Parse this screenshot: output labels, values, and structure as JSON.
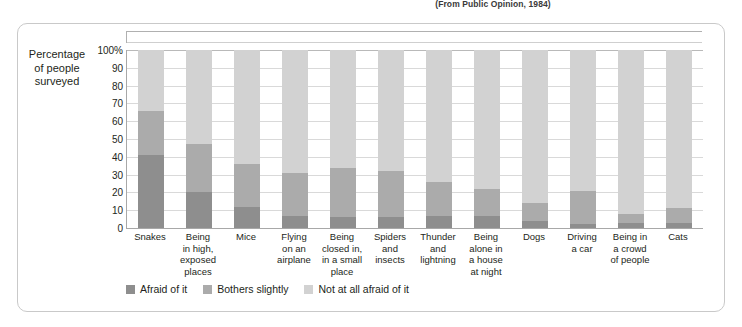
{
  "source_note": "(From Public Opinion, 1984)",
  "axis_title": "Percentage\nof people\nsurveyed",
  "axis_title_lines": [
    "Percentage",
    "of people",
    "surveyed"
  ],
  "colors": {
    "afraid": "#8e8e8e",
    "bothers": "#ababab",
    "not_afraid": "#d2d2d2",
    "gridline": "#d9d9d9",
    "axis": "#a8a8a8",
    "frame": "#c9c9c9",
    "text": "#231f20"
  },
  "legend": {
    "items": [
      {
        "label": "Afraid of it",
        "color_key": "afraid"
      },
      {
        "label": "Bothers slightly",
        "color_key": "bothers"
      },
      {
        "label": "Not at all afraid of it",
        "color_key": "not_afraid"
      }
    ]
  },
  "chart_data": {
    "type": "bar",
    "title": "",
    "subtitle": "",
    "xlabel": "",
    "ylabel": "Percentage of people surveyed",
    "ylim": [
      0,
      100
    ],
    "ytick_labels": [
      "100%",
      "90",
      "80",
      "70",
      "60",
      "50",
      "40",
      "30",
      "20",
      "10",
      "0"
    ],
    "ytick_values": [
      100,
      90,
      80,
      70,
      60,
      50,
      40,
      30,
      20,
      10,
      0
    ],
    "grid": true,
    "stacked": true,
    "legend_position": "bottom-left",
    "categories": [
      "Snakes",
      "Being in high, exposed places",
      "Mice",
      "Flying on an airplane",
      "Being closed in, in a small place",
      "Spiders and insects",
      "Thunder and lightning",
      "Being alone in a house at night",
      "Dogs",
      "Driving a car",
      "Being in a crowd of people",
      "Cats"
    ],
    "category_lines": [
      [
        "Snakes"
      ],
      [
        "Being",
        "in high,",
        "exposed",
        "places"
      ],
      [
        "Mice"
      ],
      [
        "Flying",
        "on an",
        "airplane"
      ],
      [
        "Being",
        "closed in,",
        "in a small",
        "place"
      ],
      [
        "Spiders",
        "and",
        "insects"
      ],
      [
        "Thunder",
        "and",
        "lightning"
      ],
      [
        "Being",
        "alone in",
        "a house",
        "at night"
      ],
      [
        "Dogs"
      ],
      [
        "Driving",
        "a car"
      ],
      [
        "Being in",
        "a crowd",
        "of people"
      ],
      [
        "Cats"
      ]
    ],
    "series": [
      {
        "name": "Afraid of it",
        "color": "#8e8e8e",
        "values": [
          41,
          20,
          12,
          7,
          6,
          6,
          7,
          7,
          4,
          2,
          3,
          3
        ]
      },
      {
        "name": "Bothers slightly",
        "color": "#ababab",
        "values": [
          25,
          27,
          24,
          24,
          28,
          26,
          19,
          15,
          10,
          19,
          5,
          8
        ]
      },
      {
        "name": "Not at all afraid of it",
        "color": "#d2d2d2",
        "values": [
          34,
          53,
          64,
          69,
          66,
          68,
          74,
          78,
          86,
          79,
          92,
          89
        ]
      }
    ],
    "cumulative_tops": {
      "afraid": [
        41,
        20,
        12,
        7,
        6,
        6,
        7,
        7,
        4,
        2,
        3,
        3
      ],
      "bothers": [
        66,
        47,
        36,
        31,
        34,
        32,
        26,
        22,
        14,
        21,
        8,
        11
      ],
      "total": [
        100,
        100,
        100,
        100,
        100,
        100,
        100,
        100,
        100,
        100,
        100,
        100
      ]
    }
  }
}
